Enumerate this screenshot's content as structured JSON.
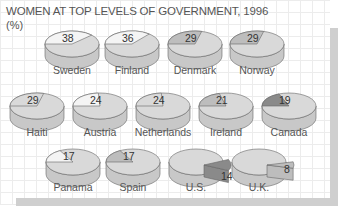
{
  "title": "WOMEN AT TOP LEVELS OF GOVERNMENT, 1996",
  "unit": "(%)",
  "colors": {
    "body": "#d9d9d9",
    "side": "#c8c8c8",
    "light": "#f4f4f4",
    "mid": "#bdbdbd",
    "dark": "#8a8a8a",
    "stroke": "#666666"
  },
  "chart_data": {
    "type": "pie",
    "title": "WOMEN AT TOP LEVELS OF GOVERNMENT, 1996",
    "ylabel": "(%)",
    "categories": [
      "Sweden",
      "Finland",
      "Denmark",
      "Norway",
      "Haiti",
      "Austria",
      "Netherlands",
      "Ireland",
      "Canada",
      "Panama",
      "Spain",
      "U.S.",
      "U.K."
    ],
    "values": [
      38,
      36,
      29,
      29,
      29,
      24,
      24,
      21,
      19,
      17,
      17,
      14,
      8
    ]
  },
  "pies": [
    {
      "country": "Sweden",
      "value": "38",
      "shade": "light"
    },
    {
      "country": "Finland",
      "value": "36",
      "shade": "light"
    },
    {
      "country": "Denmark",
      "value": "29",
      "shade": "mid"
    },
    {
      "country": "Norway",
      "value": "29",
      "shade": "mid"
    },
    {
      "country": "Haiti",
      "value": "29",
      "shade": "body"
    },
    {
      "country": "Austria",
      "value": "24",
      "shade": "light"
    },
    {
      "country": "Netherlands",
      "value": "24",
      "shade": "body"
    },
    {
      "country": "Ireland",
      "value": "21",
      "shade": "mid"
    },
    {
      "country": "Canada",
      "value": "19",
      "shade": "dark"
    },
    {
      "country": "Panama",
      "value": "17",
      "shade": "light"
    },
    {
      "country": "Spain",
      "value": "17",
      "shade": "mid"
    },
    {
      "country": "U.S.",
      "value": "14",
      "shade": "dark"
    },
    {
      "country": "U.K.",
      "value": "8",
      "shade": "mid"
    }
  ]
}
